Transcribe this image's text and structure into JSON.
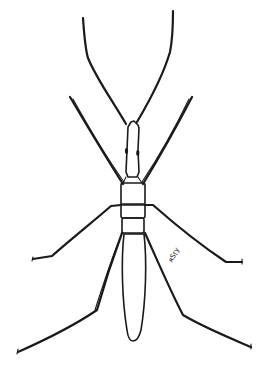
{
  "illustration": {
    "subject": "insect line drawing, dorsal view",
    "ink_color": "#1a1a1a",
    "background_color": "#ffffff",
    "parts": [
      "antennae",
      "head",
      "eyes",
      "prothorax",
      "mesothorax",
      "metathorax",
      "abdomen",
      "front-legs",
      "middle-legs",
      "hind-legs"
    ],
    "handwritten_label": "ᴙSɼy"
  }
}
